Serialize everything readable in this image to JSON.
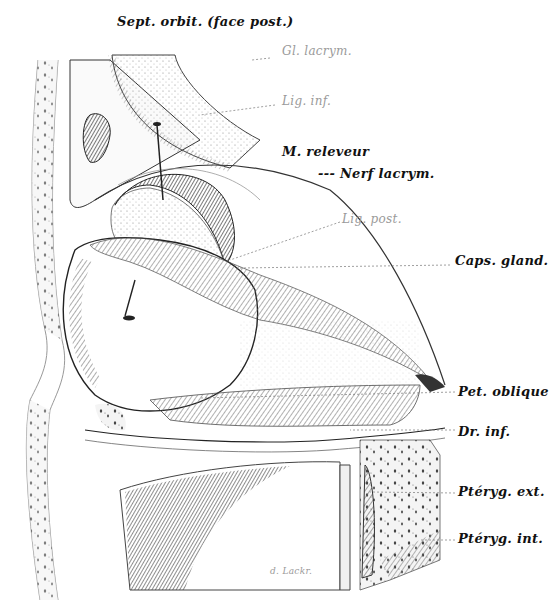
{
  "figure": {
    "colors": {
      "ink": "#222222",
      "shade": "#6a6a6a",
      "faint": "#9a9a9a",
      "paper": "#ffffff"
    }
  },
  "labels": [
    {
      "id": "sept-orbit",
      "text": "Sept. orbit. (face post.)",
      "x": 117,
      "y": 27,
      "style": "bold"
    },
    {
      "id": "gl-lacrym",
      "text": "Gl. lacrym.",
      "x": 282,
      "y": 52,
      "style": "faint"
    },
    {
      "id": "lig-inf",
      "text": "Lig. inf.",
      "x": 282,
      "y": 98,
      "style": "faint"
    },
    {
      "id": "m-releveur",
      "text": "M. releveur",
      "x": 282,
      "y": 152,
      "style": "bold"
    },
    {
      "id": "nerf-lacrym",
      "text": "--- Nerf lacrym.",
      "x": 318,
      "y": 173,
      "style": "bold"
    },
    {
      "id": "lig-post",
      "text": "Lig. post.",
      "x": 342,
      "y": 217,
      "style": "faint"
    },
    {
      "id": "caps-gland",
      "text": "Caps. gland.",
      "x": 455,
      "y": 259,
      "style": "bold"
    },
    {
      "id": "pet-oblique",
      "text": "Pet. oblique",
      "x": 458,
      "y": 385,
      "style": "bold"
    },
    {
      "id": "dr-inf",
      "text": "Dr. inf.",
      "x": 458,
      "y": 424,
      "style": "bold"
    },
    {
      "id": "pteryg-ext",
      "text": "Ptéryg. ext.",
      "x": 458,
      "y": 487,
      "style": "bold"
    },
    {
      "id": "pteryg-int",
      "text": "Ptéryg. int.",
      "x": 458,
      "y": 533,
      "style": "bold"
    },
    {
      "id": "signature",
      "text": "d. Lackr.",
      "x": 270,
      "y": 573,
      "style": "faint"
    }
  ]
}
